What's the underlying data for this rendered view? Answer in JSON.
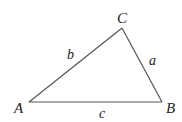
{
  "diagram": {
    "type": "triangle",
    "vertices": [
      {
        "id": "A",
        "label": "A"
      },
      {
        "id": "B",
        "label": "B"
      },
      {
        "id": "C",
        "label": "C"
      }
    ],
    "sides": [
      {
        "id": "a",
        "label": "a",
        "between": [
          "B",
          "C"
        ]
      },
      {
        "id": "b",
        "label": "b",
        "between": [
          "A",
          "C"
        ]
      },
      {
        "id": "c",
        "label": "c",
        "between": [
          "A",
          "B"
        ]
      }
    ],
    "colors": {
      "stroke": "#555555",
      "text": "#222222",
      "background": "#ffffff"
    }
  }
}
